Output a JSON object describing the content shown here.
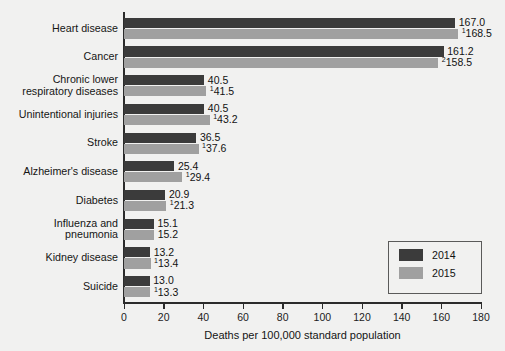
{
  "chart_data": {
    "type": "bar",
    "orientation": "horizontal",
    "title": "",
    "xlabel": "Deaths per 100,000 standard population",
    "ylabel": "",
    "xlim": [
      0,
      180
    ],
    "xticks": [
      0,
      20,
      40,
      60,
      80,
      100,
      120,
      140,
      160,
      180
    ],
    "grid": false,
    "legend_position": "bottom-right",
    "categories": [
      "Heart disease",
      "Cancer",
      "Chronic lower respiratory diseases",
      "Unintentional injuries",
      "Stroke",
      "Alzheimer's disease",
      "Diabetes",
      "Influenza and pneumonia",
      "Kidney disease",
      "Suicide"
    ],
    "category_lines": [
      [
        "Heart disease"
      ],
      [
        "Cancer"
      ],
      [
        "Chronic lower",
        "respiratory diseases"
      ],
      [
        "Unintentional injuries"
      ],
      [
        "Stroke"
      ],
      [
        "Alzheimer's disease"
      ],
      [
        "Diabetes"
      ],
      [
        "Influenza and",
        "pneumonia"
      ],
      [
        "Kidney disease"
      ],
      [
        "Suicide"
      ]
    ],
    "series": [
      {
        "name": "2014",
        "color": "#3b3b3b",
        "values": [
          167.0,
          161.2,
          40.5,
          40.5,
          36.5,
          25.4,
          20.9,
          15.1,
          13.2,
          13.0
        ],
        "labels": [
          "167.0",
          "161.2",
          "40.5",
          "40.5",
          "36.5",
          "25.4",
          "20.9",
          "15.1",
          "13.2",
          "13.0"
        ],
        "markers": [
          "",
          "",
          "",
          "",
          "",
          "",
          "",
          "",
          "",
          ""
        ]
      },
      {
        "name": "2015",
        "color": "#a0a0a0",
        "values": [
          168.5,
          158.5,
          41.5,
          43.2,
          37.6,
          29.4,
          21.3,
          15.2,
          13.4,
          13.3
        ],
        "labels": [
          "168.5",
          "158.5",
          "41.5",
          "43.2",
          "37.6",
          "29.4",
          "21.3",
          "15.2",
          "13.4",
          "13.3"
        ],
        "markers": [
          "1",
          "2",
          "1",
          "1",
          "1",
          "1",
          "1",
          "",
          "1",
          "1"
        ]
      }
    ]
  },
  "legend": {
    "items": [
      {
        "label": "2014",
        "color": "#3b3b3b"
      },
      {
        "label": "2015",
        "color": "#a0a0a0"
      }
    ]
  },
  "axis": {
    "x_title": "Deaths per 100,000 standard population",
    "x_tick_labels": [
      "0",
      "20",
      "40",
      "60",
      "80",
      "100",
      "120",
      "140",
      "160",
      "180"
    ]
  },
  "colors": {
    "background": "#f1f1f0",
    "axis": "#2b2b2b",
    "series_2014": "#3b3b3b",
    "series_2015": "#a0a0a0",
    "text": "#121212"
  }
}
